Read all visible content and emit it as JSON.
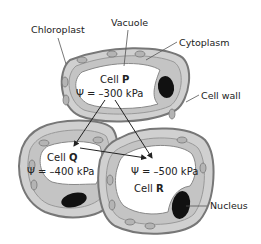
{
  "diagram": {
    "type": "plant cells water potential",
    "labels": {
      "chloroplast": "Chloroplast",
      "vacuole": "Vacuole",
      "cytoplasm": "Cytoplasm",
      "cell_wall": "Cell wall",
      "nucleus": "Nucleus"
    },
    "cells": [
      {
        "id": "P",
        "prefix": "Cell ",
        "name": "P",
        "potential": "Ψ = –300 kPa"
      },
      {
        "id": "Q",
        "prefix": "Cell ",
        "name": "Q",
        "potential": "Ψ = –400 kPa"
      },
      {
        "id": "R",
        "prefix": "Cell ",
        "name": "R",
        "potential": "Ψ = –500 kPa"
      }
    ],
    "arrows": [
      {
        "from": "P",
        "to": "Q"
      },
      {
        "from": "P",
        "to": "R"
      },
      {
        "from": "Q",
        "to": "R"
      }
    ],
    "colors": {
      "wall": "#8c8c8c",
      "cytoplasm": "#c8c8c8",
      "vacuole": "#ffffff",
      "nucleus": "#111111",
      "chloroplast": "#b4b4b4"
    }
  }
}
